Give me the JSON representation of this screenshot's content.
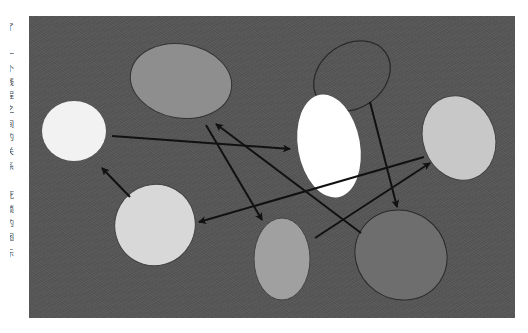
{
  "diagram": {
    "background_color": "#555555",
    "frame": {
      "x": 29,
      "y": 16,
      "width": 486,
      "height": 302
    },
    "nodes": [
      {
        "id": "white-left",
        "cx": 74,
        "cy": 131,
        "rx": 32,
        "ry": 30,
        "rot": 0,
        "fill": "#f2f2f2",
        "stroke": "none"
      },
      {
        "id": "gray-top",
        "cx": 181,
        "cy": 81,
        "rx": 51,
        "ry": 37,
        "rot": 10,
        "fill": "#8e8e8e",
        "stroke": "#333333"
      },
      {
        "id": "outline-top",
        "cx": 352,
        "cy": 76,
        "rx": 41,
        "ry": 32,
        "rot": -35,
        "fill": "none",
        "stroke": "#2a2a2a"
      },
      {
        "id": "white-center",
        "cx": 329,
        "cy": 146,
        "rx": 31,
        "ry": 52,
        "rot": -10,
        "fill": "#ffffff",
        "stroke": "none"
      },
      {
        "id": "light-right",
        "cx": 459,
        "cy": 138,
        "rx": 36,
        "ry": 43,
        "rot": -20,
        "fill": "#c8c8c8",
        "stroke": "#444444"
      },
      {
        "id": "light-bottom-left",
        "cx": 155,
        "cy": 225,
        "rx": 40,
        "ry": 41,
        "rot": 30,
        "fill": "#d8d8d8",
        "stroke": "#444444"
      },
      {
        "id": "gray-bottom",
        "cx": 282,
        "cy": 259,
        "rx": 28,
        "ry": 41,
        "rot": 0,
        "fill": "#a0a0a0",
        "stroke": "#444444"
      },
      {
        "id": "dark-bottom-right",
        "cx": 401,
        "cy": 255,
        "rx": 47,
        "ry": 44,
        "rot": 35,
        "fill": "#6e6e6e",
        "stroke": "#2a2a2a"
      }
    ],
    "edges": [
      {
        "from": "white-left",
        "to": "white-center",
        "x1": 112,
        "y1": 136,
        "x2": 290,
        "y2": 149,
        "arrow": "end"
      },
      {
        "from": "gray-top",
        "to": "gray-bottom",
        "x1": 206,
        "y1": 125,
        "x2": 262,
        "y2": 220,
        "arrow": "end"
      },
      {
        "from": "dark-bottom-right",
        "to": "gray-top",
        "x1": 361,
        "y1": 233,
        "x2": 216,
        "y2": 124,
        "arrow": "end"
      },
      {
        "from": "light-right",
        "to": "light-bottom-left",
        "x1": 424,
        "y1": 157,
        "x2": 199,
        "y2": 222,
        "arrow": "end"
      },
      {
        "from": "outline-top",
        "to": "dark-bottom-right",
        "x1": 370,
        "y1": 102,
        "x2": 397,
        "y2": 207,
        "arrow": "end"
      },
      {
        "from": "gray-bottom",
        "to": "light-right",
        "x1": 315,
        "y1": 238,
        "x2": 430,
        "y2": 163,
        "arrow": "end"
      },
      {
        "from": "light-bottom-left",
        "to": "white-left",
        "x1": 130,
        "y1": 197,
        "x2": 102,
        "y2": 168,
        "arrow": "end"
      }
    ],
    "edge_color": "#111111"
  },
  "edge_text": {
    "note": "cropped column of page text at left margin",
    "chars": [
      {
        "y": 28,
        "text": "了"
      },
      {
        "y": 55,
        "text": "一"
      },
      {
        "y": 70,
        "text": "个"
      },
      {
        "y": 83,
        "text": "线"
      },
      {
        "y": 96,
        "text": "程"
      },
      {
        "y": 110,
        "text": "之"
      },
      {
        "y": 125,
        "text": "间"
      },
      {
        "y": 138,
        "text": "的"
      },
      {
        "y": 152,
        "text": "关"
      },
      {
        "y": 167,
        "text": "系"
      },
      {
        "y": 181,
        "text": "，"
      },
      {
        "y": 196,
        "text": "死"
      },
      {
        "y": 210,
        "text": "锁"
      },
      {
        "y": 224,
        "text": "的"
      },
      {
        "y": 238,
        "text": "图"
      },
      {
        "y": 254,
        "text": "示"
      }
    ]
  }
}
